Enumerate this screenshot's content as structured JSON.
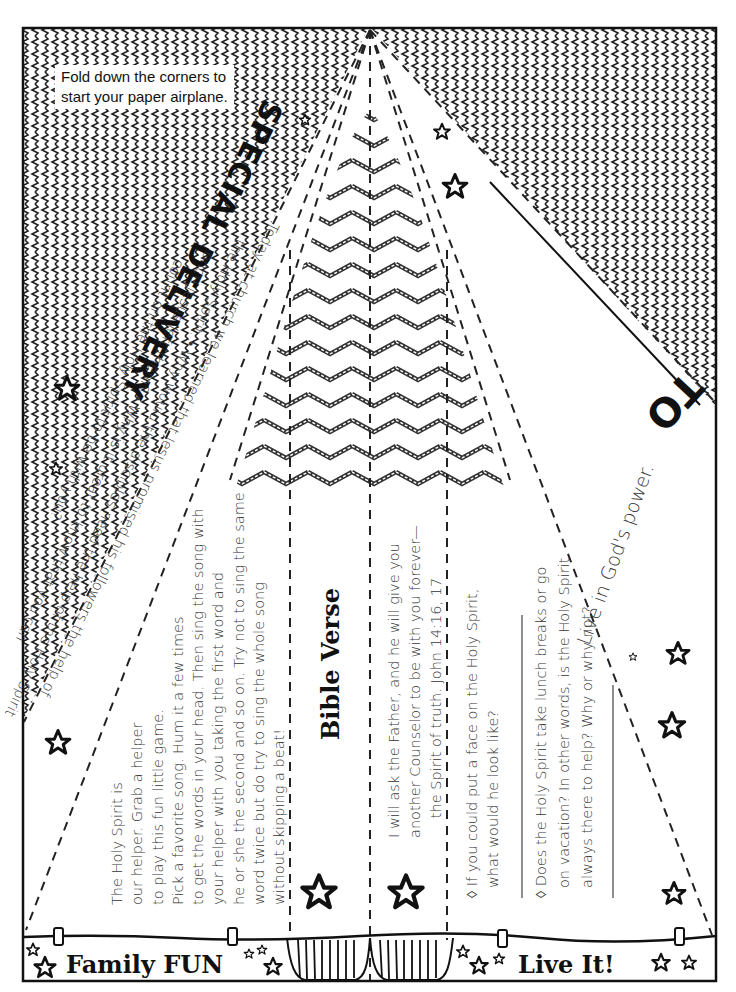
{
  "instruction": "Fold down the corners to start your paper airplane.",
  "instruction_lines": [
    "Fold down the corners to",
    "start your paper airplane."
  ],
  "header": {
    "title": "SPECIAL DELIVERY",
    "to_label": "TO"
  },
  "recap": {
    "lines": [
      "Today at church we learned that Jesus promised his followers the help of",
      "the Holy Spirit. • Why would the disciples need the help of the Holy Spirit",
      "once Jesus left them? • Why is it great to know that you can",
      "count on the Holy Spirit to be with you?"
    ]
  },
  "tagline": "Live in God's power.",
  "family_fun": {
    "label": "Family FUN",
    "lines": [
      "The Holy Spirit is",
      "our helper.  Grab a helper",
      "to play this fun little game.",
      "Pick a favorite song. Hum it a few times",
      "to get the words in your head. Then sing the song with",
      "your helper with you taking the first word and",
      "he or she the second and so on. Try not to sing the same",
      "word twice but do try to sing the whole song",
      "without skipping a beat!"
    ]
  },
  "bible_verse": {
    "title": "Bible Verse",
    "lines": [
      "I will ask the Father, and he will give you",
      "another Counselor to be with you forever—",
      "the Spirit of truth. John 14:16, 17"
    ]
  },
  "live_it": {
    "label": "Live It!",
    "questions": [
      {
        "lines": [
          "◊ If you could put a face on the Holy Spirit,",
          "what would he look like?"
        ]
      },
      {
        "lines": [
          "◊ Does the Holy Spirit take lunch breaks or go",
          "on vacation? In other words, is the Holy Spirit",
          "always there to help? Why or why not?"
        ]
      }
    ]
  },
  "colors": {
    "ink": "#111111",
    "paper": "#ffffff",
    "text": "#333333"
  },
  "icons": [
    "star-icon",
    "zigzag-pattern",
    "chevron-pattern",
    "basket-icon"
  ]
}
